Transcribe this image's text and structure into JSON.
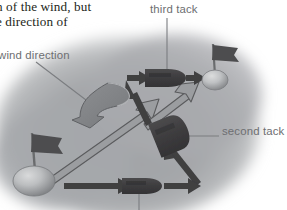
{
  "page": {
    "width": 287,
    "height": 210,
    "background": "#ffffff"
  },
  "body_text": {
    "line1": "n of the wind, but",
    "line2": "e direction of",
    "color": "#231f20"
  },
  "labels": {
    "wind_direction": "wind direction",
    "third_tack": "third tack",
    "second_tack": "second tack",
    "color": "#6d6e71"
  },
  "colors": {
    "water_blob": "#a7a9ac",
    "boat_dark": "#414042",
    "flag_dark": "#4d4d4f",
    "buoy_light": "#bcbec0",
    "arrow_solid": "#3f3f41",
    "arrow_hollow_fill": "#9b9da0",
    "arrow_hollow_stroke": "#58595b",
    "wind_arrow_fill": "#808285",
    "leader_line": "#808285"
  },
  "diagram": {
    "elements": [
      {
        "name": "start-buoy",
        "type": "buoy-with-flag",
        "x": 24,
        "y": 180
      },
      {
        "name": "finish-buoy",
        "type": "buoy-with-flag",
        "x": 215,
        "y": 79
      },
      {
        "name": "boat-first-tack",
        "type": "boat",
        "x": 143,
        "y": 188
      },
      {
        "name": "boat-second-tack",
        "type": "boat",
        "x": 165,
        "y": 137
      },
      {
        "name": "boat-third-tack",
        "type": "boat",
        "x": 163,
        "y": 78
      },
      {
        "name": "wind-arrow",
        "type": "ribbon-arrow",
        "x": 88,
        "y": 103
      },
      {
        "name": "first-tack-path",
        "type": "hollow-arrow"
      },
      {
        "name": "second-tack-path",
        "type": "hollow-arrow"
      },
      {
        "name": "third-tack-path",
        "type": "hollow-arrow"
      }
    ]
  }
}
